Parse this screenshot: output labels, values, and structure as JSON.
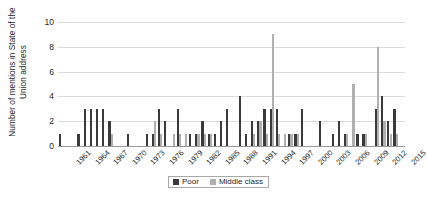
{
  "chart_data": {
    "type": "bar",
    "title": "",
    "xlabel": "",
    "ylabel": "Number of mentions in State of the Union address",
    "ylim": [
      0,
      10
    ],
    "ytick_values": [
      0,
      2,
      4,
      6,
      8,
      10
    ],
    "ytick_labels": [
      "0",
      "2",
      "4",
      "6",
      "8",
      "10"
    ],
    "grid": true,
    "legend_position": "bottom-center",
    "x": [
      1961,
      1962,
      1963,
      1964,
      1965,
      1966,
      1967,
      1968,
      1969,
      1970,
      1971,
      1972,
      1973,
      1974,
      1975,
      1976,
      1977,
      1978,
      1979,
      1980,
      1981,
      1982,
      1983,
      1984,
      1985,
      1986,
      1987,
      1988,
      1989,
      1990,
      1991,
      1992,
      1993,
      1994,
      1995,
      1996,
      1997,
      1998,
      1999,
      2000,
      2001,
      2002,
      2003,
      2004,
      2005,
      2006,
      2007,
      2008,
      2009,
      2010,
      2011,
      2012,
      2013,
      2014,
      2015,
      2016
    ],
    "xtick_labels": [
      "1961",
      "1964",
      "1967",
      "1970",
      "1973",
      "1976",
      "1979",
      "1982",
      "1985",
      "1988",
      "1991",
      "1994",
      "1997",
      "2000",
      "2003",
      "2006",
      "2009",
      "2012",
      "2015"
    ],
    "xtick_years": [
      1961,
      1964,
      1967,
      1970,
      1973,
      1976,
      1979,
      1982,
      1985,
      1988,
      1991,
      1994,
      1997,
      2000,
      2003,
      2006,
      2009,
      2012,
      2015
    ],
    "series": [
      {
        "name": "Poor",
        "color": "#3a3a3a",
        "values": [
          1,
          0,
          0,
          1,
          3,
          3,
          3,
          3,
          2,
          0,
          0,
          1,
          0,
          0,
          1,
          1,
          3,
          2,
          0,
          3,
          0,
          1,
          1,
          2,
          1,
          1,
          2,
          3,
          0,
          4,
          1,
          2,
          2,
          3,
          3,
          3,
          0,
          1,
          1,
          3,
          0,
          0,
          2,
          0,
          1,
          2,
          1,
          0,
          1,
          1,
          0,
          3,
          4,
          2,
          3,
          0
        ]
      },
      {
        "name": "Middle class",
        "color": "#b0b0b0",
        "values": [
          0,
          0,
          0,
          0,
          0,
          0,
          0,
          0,
          1,
          0,
          0,
          0,
          0,
          0,
          0,
          2,
          1,
          0,
          1,
          1,
          1,
          0,
          1,
          1,
          1,
          0,
          0,
          0,
          0,
          0,
          0,
          1,
          2,
          1,
          9,
          1,
          1,
          1,
          1,
          0,
          0,
          0,
          0,
          0,
          0,
          0,
          1,
          5,
          0,
          1,
          0,
          8,
          2,
          1,
          1,
          0
        ]
      }
    ]
  },
  "legend": {
    "entries": [
      {
        "label": "Poor",
        "swatch": "poor"
      },
      {
        "label": "Middle class",
        "swatch": "middle"
      }
    ]
  }
}
